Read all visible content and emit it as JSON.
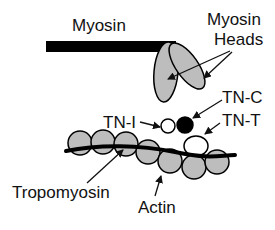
{
  "diagram": {
    "labels": {
      "myosin": "Myosin",
      "myosin_heads_line1": "Myosin",
      "myosin_heads_line2": "Heads",
      "tn_c": "TN-C",
      "tn_i": "TN-I",
      "tn_t": "TN-T",
      "tropomyosin": "Tropomyosin",
      "actin": "Actin"
    },
    "colors": {
      "filament": "#000000",
      "myosin_head_fill": "#bdbdbd",
      "actin_fill": "#bdbdbd",
      "tn_c_fill": "#000000",
      "tn_i_fill": "#ffffff",
      "tn_t_fill": "#ffffff",
      "background": "#ffffff"
    }
  }
}
